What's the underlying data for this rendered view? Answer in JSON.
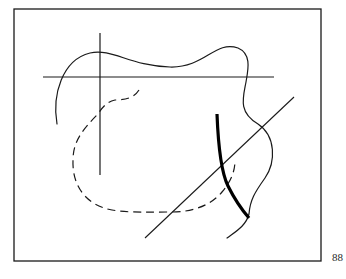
{
  "figure": {
    "frame": {
      "x": 14,
      "y": 9,
      "width": 307,
      "height": 252
    },
    "stroke_color": "#1a1a1a",
    "elements": {
      "horizontal_line": {
        "x1": 43,
        "y1": 77,
        "x2": 274,
        "y2": 77
      },
      "vertical_line": {
        "x1": 100,
        "y1": 33,
        "x2": 100,
        "y2": 175
      },
      "diagonal_line": {
        "x1": 294,
        "y1": 97,
        "x2": 145,
        "y2": 238
      },
      "thin_wavy_curve": "M57,124 C52,95 62,60 90,53 C112,48 130,66 170,67 C205,68 215,40 238,48 C252,54 248,70 246,82 C243,98 238,112 258,124 C276,136 276,162 265,178 C255,192 250,200 249,214 C246,226 235,232 227,238",
      "dashed_curve": "M139,90 C134,98 125,100 115,100 C106,102 102,108 98,114 C82,130 73,142 73,160 C72,185 85,205 112,210 C130,213 150,212 172,212 C195,212 212,204 222,192 C232,180 235,170 235,160",
      "thick_curve": "M217,114 C218,140 220,170 228,186 C236,202 242,210 249,218"
    }
  },
  "page": {
    "number": "88"
  }
}
